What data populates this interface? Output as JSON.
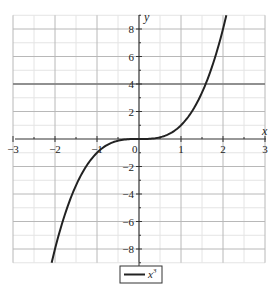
{
  "chart_data": {
    "type": "line",
    "title": "",
    "xlabel": "x",
    "ylabel": "y",
    "xlim": [
      -3,
      3
    ],
    "ylim": [
      -9,
      9
    ],
    "grid": true,
    "legend_position": "bottom-center",
    "x_ticks": [
      -3,
      -2,
      -1,
      0,
      1,
      2,
      3
    ],
    "x_tick_labels": [
      "−3",
      "−2",
      "−1",
      "0",
      "1",
      "2",
      "3"
    ],
    "y_ticks": [
      -8,
      -6,
      -4,
      -2,
      2,
      4,
      6,
      8
    ],
    "y_tick_labels": [
      "−8",
      "−6",
      "−4",
      "−2",
      "2",
      "4",
      "6",
      "8"
    ],
    "reference_lines": [
      {
        "axis": "y",
        "value": 4
      }
    ],
    "series": [
      {
        "name": "x³",
        "function": "x^3",
        "x": [
          -2.08,
          -2.0,
          -1.75,
          -1.5,
          -1.25,
          -1.0,
          -0.75,
          -0.5,
          -0.25,
          0,
          0.25,
          0.5,
          0.75,
          1.0,
          1.25,
          1.5,
          1.75,
          2.0,
          2.08
        ],
        "values": [
          -9.0,
          -8.0,
          -5.36,
          -3.375,
          -1.95,
          -1.0,
          -0.42,
          -0.125,
          -0.016,
          0,
          0.016,
          0.125,
          0.42,
          1.0,
          1.95,
          3.375,
          5.36,
          8.0,
          9.0
        ],
        "color": "#222222"
      }
    ]
  },
  "legend": {
    "label_base": "x",
    "label_exp": "3"
  },
  "axes": {
    "x_label": "x",
    "y_label": "y",
    "origin_label": "0"
  }
}
